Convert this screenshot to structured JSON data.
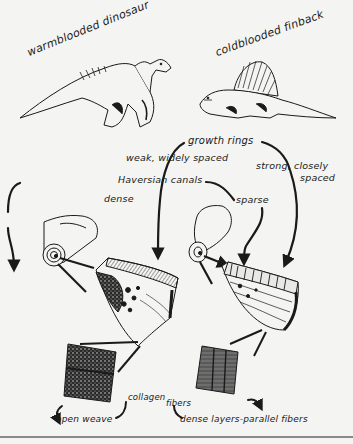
{
  "figure": {
    "animals": {
      "warm": {
        "label": "warmblooded dinosaur"
      },
      "cold": {
        "label": "coldblooded finback"
      }
    },
    "labels": {
      "growth_rings": "growth rings",
      "weak_spaced": "weak, widely spaced",
      "strong_closely": "strong, closely",
      "spaced": "spaced",
      "haversian": "Haversian canals",
      "dense": "dense",
      "sparse": "sparse",
      "collagen": "collagen",
      "fibers": "fibers",
      "open_weave": "open weave",
      "dense_layers": "dense layers-parallel fibers"
    },
    "colors": {
      "ink": "#1a1a1a",
      "paper": "#f4f4f2",
      "rule": "#8a8a8a"
    }
  }
}
